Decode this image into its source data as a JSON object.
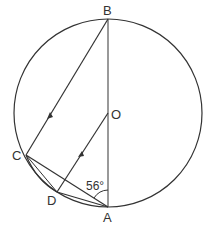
{
  "diagram": {
    "type": "circle-geometry",
    "circle": {
      "center": "O"
    },
    "points": {
      "B": {
        "label": "B",
        "x": 108,
        "y": 19
      },
      "O": {
        "label": "O",
        "x": 108,
        "y": 113
      },
      "A": {
        "label": "A",
        "x": 108,
        "y": 207
      },
      "C": {
        "label": "C",
        "x": 26,
        "y": 155
      },
      "D": {
        "label": "D",
        "x": 57,
        "y": 192
      }
    },
    "segments": [
      "BA",
      "BC",
      "OD",
      "CA",
      "DA",
      "CD"
    ],
    "parallel_marks": [
      "BC",
      "OD"
    ],
    "angle": {
      "label": "56°",
      "at": "A",
      "between": [
        "AO",
        "AC"
      ]
    }
  }
}
